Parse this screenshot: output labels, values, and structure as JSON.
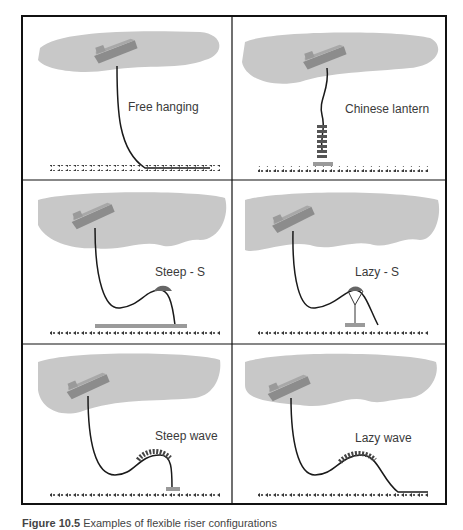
{
  "figure": {
    "colors": {
      "sea": "#c8c8c8",
      "ship_hull": "#8c8c8c",
      "ship_deck": "#a8a8a8",
      "riser": "#1a1a1a",
      "seabed": "#3a3a3a",
      "anchor_base": "#9a9a9a",
      "border": "#111111"
    },
    "panels": [
      {
        "id": "free-hanging",
        "label": "Free hanging"
      },
      {
        "id": "chinese-lantern",
        "label": "Chinese lantern"
      },
      {
        "id": "steep-s",
        "label": "Steep - S"
      },
      {
        "id": "lazy-s",
        "label": "Lazy - S"
      },
      {
        "id": "steep-wave",
        "label": "Steep wave"
      },
      {
        "id": "lazy-wave",
        "label": "Lazy wave"
      }
    ],
    "caption": {
      "number": "Figure 10.5",
      "text": "Examples of flexible riser configurations"
    }
  }
}
